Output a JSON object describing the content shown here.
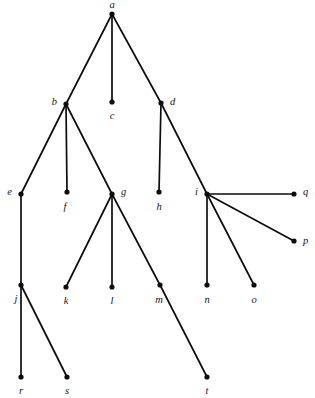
{
  "figure": {
    "type": "rooted-tree-diagram",
    "title": "",
    "background_color": "#ffffff",
    "node_color": "#0d0d0d",
    "edge_color": "#0d0d0d",
    "label_color": "#141414",
    "node_radius": 2.6,
    "edge_width": 1.7,
    "width": 315,
    "height": 398
  },
  "graph_data": {
    "type": "tree",
    "root": "a",
    "node_count": 20,
    "edge_count": 19,
    "nodes": [
      {
        "id": "a",
        "label": "a",
        "x": 112,
        "y": 14,
        "label_pos": "above",
        "label_x": 112,
        "label_y": 6,
        "level": 0
      },
      {
        "id": "b",
        "label": "b",
        "x": 66,
        "y": 104,
        "label_pos": "left",
        "label_x": 57,
        "label_y": 103,
        "level": 1
      },
      {
        "id": "c",
        "label": "c",
        "x": 112,
        "y": 102,
        "label_pos": "below",
        "label_x": 112,
        "label_y": 117,
        "level": 1
      },
      {
        "id": "d",
        "label": "d",
        "x": 161,
        "y": 103,
        "label_pos": "right",
        "label_x": 170,
        "label_y": 103,
        "level": 1
      },
      {
        "id": "e",
        "label": "e",
        "x": 21,
        "y": 194,
        "label_pos": "left",
        "label_x": 12,
        "label_y": 193,
        "level": 2
      },
      {
        "id": "f",
        "label": "f",
        "x": 67,
        "y": 192,
        "label_pos": "below",
        "label_x": 65,
        "label_y": 208,
        "level": 2
      },
      {
        "id": "g",
        "label": "g",
        "x": 112,
        "y": 194,
        "label_pos": "right",
        "label_x": 121,
        "label_y": 193,
        "level": 2
      },
      {
        "id": "h",
        "label": "h",
        "x": 159,
        "y": 192,
        "label_pos": "below",
        "label_x": 159,
        "label_y": 208,
        "level": 2
      },
      {
        "id": "i",
        "label": "i",
        "x": 207,
        "y": 194,
        "label_pos": "left",
        "label_x": 198,
        "label_y": 193,
        "level": 2
      },
      {
        "id": "j",
        "label": "j",
        "x": 21,
        "y": 285,
        "label_pos": "below",
        "label_x": 16,
        "label_y": 300,
        "level": 3
      },
      {
        "id": "k",
        "label": "k",
        "x": 66,
        "y": 287,
        "label_pos": "below",
        "label_x": 66,
        "label_y": 302,
        "level": 3
      },
      {
        "id": "l",
        "label": "l",
        "x": 112,
        "y": 287,
        "label_pos": "below",
        "label_x": 112,
        "label_y": 302,
        "level": 3
      },
      {
        "id": "m",
        "label": "m",
        "x": 160,
        "y": 285,
        "label_pos": "below",
        "label_x": 159,
        "label_y": 301,
        "level": 3
      },
      {
        "id": "n",
        "label": "n",
        "x": 207,
        "y": 285,
        "label_pos": "below",
        "label_x": 207,
        "label_y": 301,
        "level": 3
      },
      {
        "id": "o",
        "label": "o",
        "x": 254,
        "y": 285,
        "label_pos": "below",
        "label_x": 254,
        "label_y": 301,
        "level": 3
      },
      {
        "id": "p",
        "label": "p",
        "x": 294,
        "y": 241,
        "label_pos": "right",
        "label_x": 303,
        "label_y": 242,
        "level": 3
      },
      {
        "id": "q",
        "label": "q",
        "x": 294,
        "y": 194,
        "label_pos": "right",
        "label_x": 303,
        "label_y": 193,
        "level": 3
      },
      {
        "id": "r",
        "label": "r",
        "x": 21,
        "y": 377,
        "label_pos": "below",
        "label_x": 21,
        "label_y": 392,
        "level": 4
      },
      {
        "id": "s",
        "label": "s",
        "x": 67,
        "y": 377,
        "label_pos": "below",
        "label_x": 67,
        "label_y": 392,
        "level": 4
      },
      {
        "id": "t",
        "label": "t",
        "x": 207,
        "y": 377,
        "label_pos": "below",
        "label_x": 207,
        "label_y": 392,
        "level": 4
      }
    ],
    "edges": [
      {
        "from": "a",
        "to": "b"
      },
      {
        "from": "a",
        "to": "c"
      },
      {
        "from": "a",
        "to": "d"
      },
      {
        "from": "b",
        "to": "e"
      },
      {
        "from": "b",
        "to": "f"
      },
      {
        "from": "b",
        "to": "g"
      },
      {
        "from": "d",
        "to": "h"
      },
      {
        "from": "d",
        "to": "i"
      },
      {
        "from": "e",
        "to": "j"
      },
      {
        "from": "g",
        "to": "k"
      },
      {
        "from": "g",
        "to": "l"
      },
      {
        "from": "g",
        "to": "m"
      },
      {
        "from": "i",
        "to": "n"
      },
      {
        "from": "i",
        "to": "o"
      },
      {
        "from": "i",
        "to": "p"
      },
      {
        "from": "i",
        "to": "q"
      },
      {
        "from": "j",
        "to": "r"
      },
      {
        "from": "j",
        "to": "s"
      },
      {
        "from": "m",
        "to": "t"
      }
    ]
  }
}
